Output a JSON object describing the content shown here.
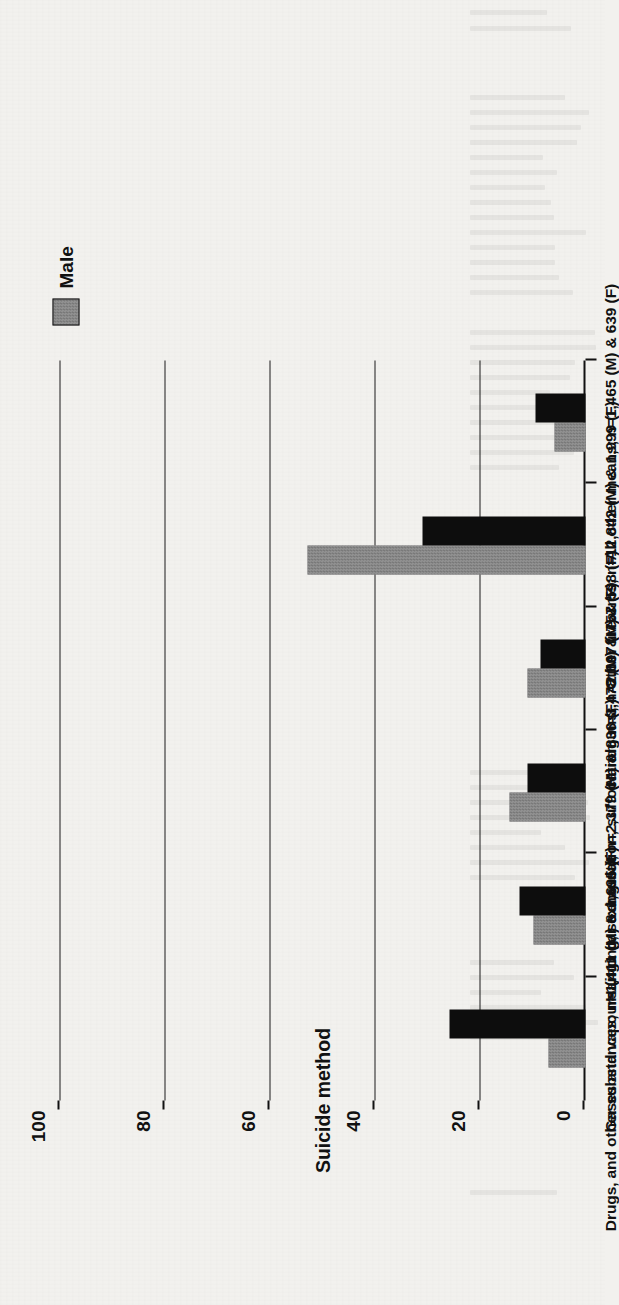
{
  "figure": {
    "legend": [
      {
        "key": "male",
        "label": "Male",
        "swatch": "legend-swatch-male",
        "color": "#8a8a8a"
      }
    ],
    "category_axis_title": "Suicide method",
    "value_axis_title": "Percentage of total (M=24,272; F=6,524)"
  },
  "chart_data": {
    "type": "bar",
    "title": "",
    "xlabel": "Suicide method",
    "ylabel": "Percentage of total (M=24,272; F=6,524)",
    "orientation": "vertical-rotated",
    "grid": true,
    "legend_position": "top-right",
    "ylim": [
      0,
      100
    ],
    "yticks": [
      0,
      20,
      40,
      60,
      80,
      100
    ],
    "ytick_labels": [
      "0",
      "20",
      "40",
      "60",
      "80",
      "100"
    ],
    "categories": [
      "Drugs, and other substances; n=1,411 (M) & 1,695 (F)",
      "Gases and vapours (inc. car exhaust); n=2,379 (M) & 836 (F)",
      "Hanging, strangulation, suffocation; n=3,478 (M) & 757 (F)",
      "Handguns; n=2,697 (M) & 598 (F)",
      "Other firearms; n=12,842 (M) & 1,999 (F)",
      "All other means; n=1,465 (M) & 639 (F)"
    ],
    "series": [
      {
        "name": "Male",
        "color": "#8a8a8a",
        "values": [
          7.0,
          10.0,
          14.5,
          11.0,
          53.0,
          6.0
        ]
      },
      {
        "name": "Female",
        "color": "#0d0d0d",
        "values": [
          26.0,
          12.5,
          11.0,
          8.5,
          31.0,
          9.5
        ]
      }
    ],
    "counts": {
      "male_total": "24,272",
      "female_total": "6,524",
      "per_category": [
        {
          "male": "1,411",
          "female": "1,695"
        },
        {
          "male": "2,379",
          "female": "836"
        },
        {
          "male": "3,478",
          "female": "757"
        },
        {
          "male": "2,697",
          "female": "598"
        },
        {
          "male": "12,842",
          "female": "1,999"
        },
        {
          "male": "1,465",
          "female": "639"
        }
      ]
    }
  }
}
